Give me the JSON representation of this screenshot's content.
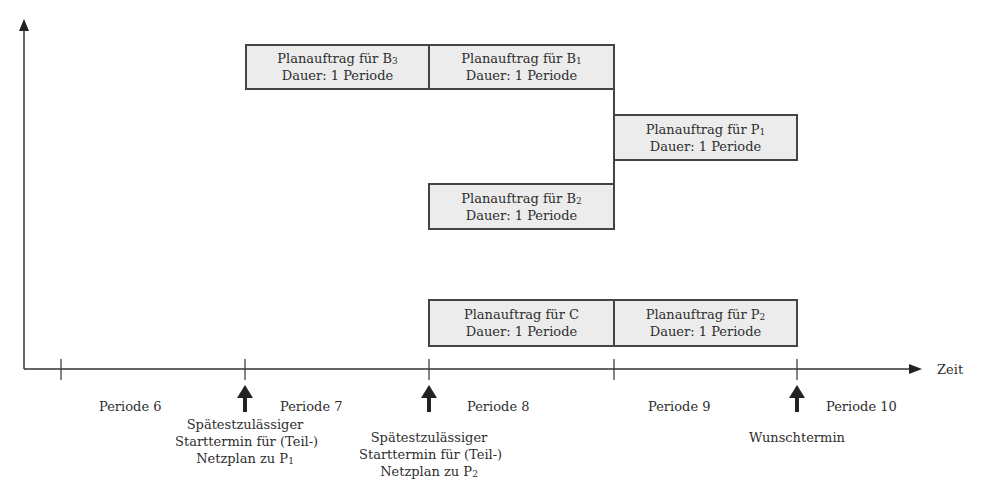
{
  "diagram": {
    "type": "gantt-timeline",
    "axis": {
      "x_label": "Zeit",
      "periods": [
        {
          "label": "Periode 6"
        },
        {
          "label": "Periode 7"
        },
        {
          "label": "Periode 8"
        },
        {
          "label": "Periode 9"
        },
        {
          "label": "Periode 10"
        }
      ]
    },
    "orders": [
      {
        "id": "B3",
        "title": "Planauftrag für B",
        "sub": "3",
        "duration": "Dauer: 1 Periode",
        "period": "Periode 7"
      },
      {
        "id": "B1",
        "title": "Planauftrag für B",
        "sub": "1",
        "duration": "Dauer: 1 Periode",
        "period": "Periode 8"
      },
      {
        "id": "P1",
        "title": "Planauftrag für P",
        "sub": "1",
        "duration": "Dauer: 1 Periode",
        "period": "Periode 9"
      },
      {
        "id": "B2",
        "title": "Planauftrag für B",
        "sub": "2",
        "duration": "Dauer: 1 Periode",
        "period": "Periode 8"
      },
      {
        "id": "C",
        "title": "Planauftrag für C",
        "sub": "",
        "duration": "Dauer: 1 Periode",
        "period": "Periode 8"
      },
      {
        "id": "P2",
        "title": "Planauftrag für P",
        "sub": "2",
        "duration": "Dauer: 1 Periode",
        "period": "Periode 9"
      }
    ],
    "markers": [
      {
        "line1": "Spätestzulässiger",
        "line2": "Starttermin für (Teil-)",
        "line3": "Netzplan zu P",
        "sub": "1"
      },
      {
        "line1": "Spätestzulässiger",
        "line2": "Starttermin für (Teil-)",
        "line3": "Netzplan zu P",
        "sub": "2"
      },
      {
        "line1": "Wunschtermin"
      }
    ],
    "colors": {
      "box_fill": "#ececec",
      "box_border": "#444444",
      "line": "#333333",
      "text": "#2e2e2e"
    }
  }
}
